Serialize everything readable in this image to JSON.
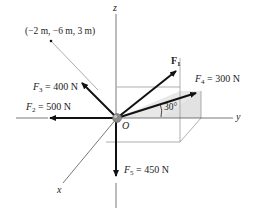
{
  "diagram": {
    "type": "3D force vector diagram",
    "axes": {
      "x_label": "x",
      "y_label": "y",
      "z_label": "z"
    },
    "origin_label": "O",
    "point_label": "(−2 m, −6 m, 3 m)",
    "angle_label": "30°",
    "forces": [
      {
        "id": "F1",
        "sym": "F",
        "sub": "1",
        "magnitude": "",
        "label": ""
      },
      {
        "id": "F2",
        "sym": "F",
        "sub": "2",
        "eq": "= 500 N"
      },
      {
        "id": "F3",
        "sym": "F",
        "sub": "3",
        "eq": "= 400 N"
      },
      {
        "id": "F4",
        "sym": "F",
        "sub": "4",
        "eq": "= 300 N"
      },
      {
        "id": "F5",
        "sym": "F",
        "sub": "5",
        "eq": "= 450 N"
      }
    ],
    "colors": {
      "arrow": "#111111",
      "axis": "#555555",
      "box_edge": "#9a9a9a",
      "shaded_plane": "#e6e6e6",
      "origin_ball": "#8a8a8a"
    }
  }
}
